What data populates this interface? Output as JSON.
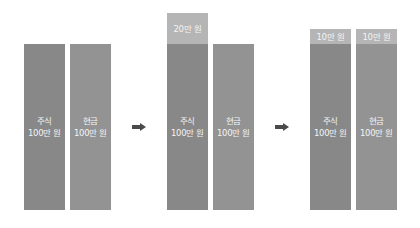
{
  "colors": {
    "stock": "#888888",
    "cash": "#939393",
    "extra": "#b5b5b5",
    "arrow": "#4a4a4a"
  },
  "groups": [
    {
      "bars": [
        {
          "label_line1": "주식",
          "label_line2": "100만 원"
        },
        {
          "label_line1": "현금",
          "label_line2": "100만 원"
        }
      ]
    },
    {
      "extra": "20만 원",
      "bars": [
        {
          "label_line1": "주식",
          "label_line2": "100만 원"
        },
        {
          "label_line1": "현금",
          "label_line2": "100만 원"
        }
      ]
    },
    {
      "extras": [
        "10만 원",
        "10만 원"
      ],
      "bars": [
        {
          "label_line1": "주식",
          "label_line2": "100만 원"
        },
        {
          "label_line1": "현금",
          "label_line2": "100만 원"
        }
      ]
    }
  ]
}
